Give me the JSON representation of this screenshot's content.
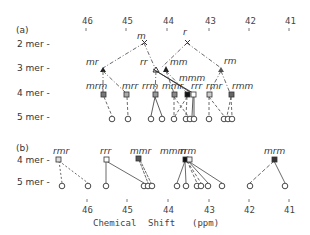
{
  "panel_a": {
    "label": "(a)",
    "rows": [
      "2 mer -",
      "3 mer -",
      "4 mer -",
      "5 mer -"
    ],
    "nodes_2mer": [
      "m",
      "r"
    ],
    "nodes_3mer": [
      "mr",
      "rr",
      "mm",
      "rm"
    ],
    "nodes_4mer": [
      "mrm",
      "mrr",
      "rrm",
      "mmr",
      "mmm",
      "rrr",
      "rmr",
      "rmm"
    ]
  },
  "panel_b": {
    "label": "(b)",
    "rows": [
      "4 mer -",
      "5 mer -"
    ],
    "nodes_4mer": [
      "rmr",
      "rrr",
      "mmr",
      "mmm",
      "rrm",
      "mrm"
    ]
  },
  "axis": {
    "ticks": [
      "46",
      "45",
      "44",
      "43",
      "42",
      "41"
    ],
    "xlabel_parts": [
      "Chemical",
      "Shift",
      "(ppm)"
    ]
  }
}
